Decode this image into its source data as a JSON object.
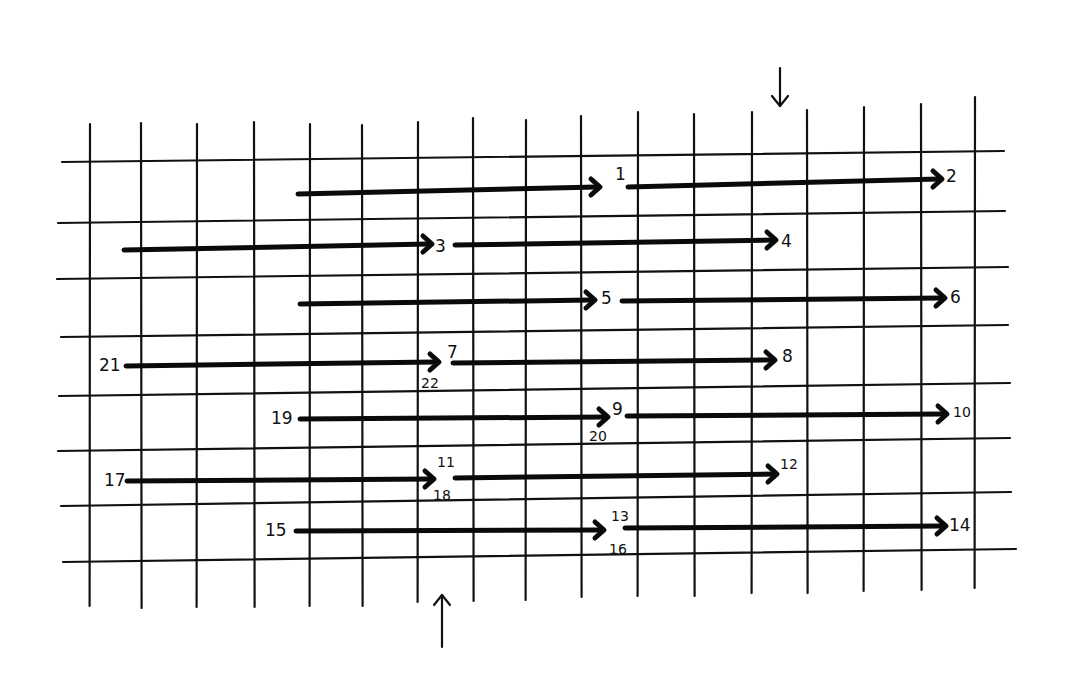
{
  "diagram": {
    "grid": {
      "vertical_lines": [
        {
          "x": 90,
          "top": 124,
          "bottom": 606
        },
        {
          "x": 141,
          "top": 123,
          "bottom": 608
        },
        {
          "x": 197,
          "top": 124,
          "bottom": 607
        },
        {
          "x": 254,
          "top": 122,
          "bottom": 607
        },
        {
          "x": 310,
          "top": 124,
          "bottom": 606
        },
        {
          "x": 362,
          "top": 125,
          "bottom": 606
        },
        {
          "x": 418,
          "top": 122,
          "bottom": 602
        },
        {
          "x": 473,
          "top": 118,
          "bottom": 601
        },
        {
          "x": 526,
          "top": 120,
          "bottom": 600
        },
        {
          "x": 581,
          "top": 116,
          "bottom": 597
        },
        {
          "x": 638,
          "top": 112,
          "bottom": 596
        },
        {
          "x": 694,
          "top": 114,
          "bottom": 596
        },
        {
          "x": 752,
          "top": 112,
          "bottom": 593
        },
        {
          "x": 807,
          "top": 110,
          "bottom": 593
        },
        {
          "x": 864,
          "top": 107,
          "bottom": 591
        },
        {
          "x": 921,
          "top": 104,
          "bottom": 590
        },
        {
          "x": 975,
          "top": 97,
          "bottom": 588
        }
      ],
      "horizontal_lines": [
        {
          "x1": 62,
          "y1": 162,
          "x2": 1004,
          "y2": 151
        },
        {
          "x1": 58,
          "y1": 223,
          "x2": 1005,
          "y2": 211
        },
        {
          "x1": 57,
          "y1": 279,
          "x2": 1008,
          "y2": 267
        },
        {
          "x1": 61,
          "y1": 337,
          "x2": 1008,
          "y2": 325
        },
        {
          "x1": 59,
          "y1": 396,
          "x2": 1010,
          "y2": 383
        },
        {
          "x1": 58,
          "y1": 451,
          "x2": 1010,
          "y2": 438
        },
        {
          "x1": 61,
          "y1": 506,
          "x2": 1011,
          "y2": 492
        },
        {
          "x1": 63,
          "y1": 562,
          "x2": 1016,
          "y2": 549
        }
      ]
    },
    "arrows": [
      {
        "id": "a1",
        "x1": 298,
        "y1": 194,
        "x2": 600,
        "y2": 187
      },
      {
        "id": "a2",
        "x1": 628,
        "y1": 187,
        "x2": 942,
        "y2": 179
      },
      {
        "id": "a3",
        "x1": 124,
        "y1": 250,
        "x2": 432,
        "y2": 244
      },
      {
        "id": "a4",
        "x1": 455,
        "y1": 245,
        "x2": 776,
        "y2": 240
      },
      {
        "id": "a5",
        "x1": 300,
        "y1": 304,
        "x2": 595,
        "y2": 300
      },
      {
        "id": "a6",
        "x1": 622,
        "y1": 301,
        "x2": 945,
        "y2": 298
      },
      {
        "id": "a7",
        "x1": 126,
        "y1": 366,
        "x2": 439,
        "y2": 362
      },
      {
        "id": "a8",
        "x1": 453,
        "y1": 363,
        "x2": 775,
        "y2": 360
      },
      {
        "id": "a9",
        "x1": 300,
        "y1": 419,
        "x2": 608,
        "y2": 417
      },
      {
        "id": "a10",
        "x1": 627,
        "y1": 416,
        "x2": 947,
        "y2": 414
      },
      {
        "id": "a11",
        "x1": 127,
        "y1": 481,
        "x2": 434,
        "y2": 479
      },
      {
        "id": "a12",
        "x1": 455,
        "y1": 478,
        "x2": 777,
        "y2": 474
      },
      {
        "id": "a13",
        "x1": 296,
        "y1": 531,
        "x2": 604,
        "y2": 530
      },
      {
        "id": "a14",
        "x1": 625,
        "y1": 528,
        "x2": 946,
        "y2": 526
      }
    ],
    "labels": [
      {
        "text": "1",
        "x": 615,
        "y": 180,
        "size": "normal"
      },
      {
        "text": "2",
        "x": 946,
        "y": 182,
        "size": "normal"
      },
      {
        "text": "3",
        "x": 435,
        "y": 252,
        "size": "normal"
      },
      {
        "text": "4",
        "x": 781,
        "y": 247,
        "size": "normal"
      },
      {
        "text": "5",
        "x": 601,
        "y": 304,
        "size": "normal"
      },
      {
        "text": "6",
        "x": 950,
        "y": 303,
        "size": "normal"
      },
      {
        "text": "7",
        "x": 447,
        "y": 358,
        "size": "normal"
      },
      {
        "text": "8",
        "x": 782,
        "y": 362,
        "size": "normal"
      },
      {
        "text": "9",
        "x": 612,
        "y": 415,
        "size": "normal"
      },
      {
        "text": "10",
        "x": 953,
        "y": 417,
        "size": "small"
      },
      {
        "text": "11",
        "x": 437,
        "y": 467,
        "size": "small"
      },
      {
        "text": "12",
        "x": 780,
        "y": 469,
        "size": "small"
      },
      {
        "text": "13",
        "x": 611,
        "y": 521,
        "size": "small"
      },
      {
        "text": "14",
        "x": 949,
        "y": 531,
        "size": "normal"
      },
      {
        "text": "15",
        "x": 265,
        "y": 536,
        "size": "normal"
      },
      {
        "text": "16",
        "x": 609,
        "y": 554,
        "size": "small"
      },
      {
        "text": "17",
        "x": 104,
        "y": 486,
        "size": "normal"
      },
      {
        "text": "18",
        "x": 433,
        "y": 500,
        "size": "small"
      },
      {
        "text": "19",
        "x": 271,
        "y": 424,
        "size": "normal"
      },
      {
        "text": "20",
        "x": 589,
        "y": 441,
        "size": "small"
      },
      {
        "text": "21",
        "x": 99,
        "y": 371,
        "size": "normal"
      },
      {
        "text": "22",
        "x": 421,
        "y": 388,
        "size": "small"
      }
    ],
    "direction_markers": [
      {
        "name": "top-down-arrow",
        "x": 780,
        "y_start": 68,
        "y_end": 106,
        "direction": "down"
      },
      {
        "name": "bottom-up-arrow",
        "x": 442,
        "y_start": 647,
        "y_end": 595,
        "direction": "up"
      }
    ]
  }
}
